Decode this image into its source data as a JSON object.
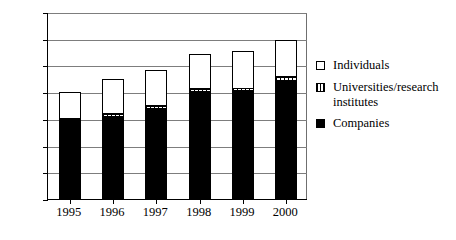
{
  "chart_data": {
    "type": "bar",
    "stacked": true,
    "title": "",
    "xlabel": "",
    "ylabel": "",
    "categories": [
      "1995",
      "1996",
      "1997",
      "1998",
      "1999",
      "2000"
    ],
    "ylim": [
      0,
      700
    ],
    "yticks": [
      0,
      100,
      200,
      300,
      400,
      500,
      600,
      700
    ],
    "grid": true,
    "legend_position": "right",
    "series": [
      {
        "name": "Companies",
        "color": "#000000",
        "pattern": "solid",
        "values": [
          298,
          308,
          338,
          402,
          405,
          443
        ]
      },
      {
        "name": "Universities/research institutes",
        "color": "#ffffff",
        "pattern": "dotted",
        "values": [
          0,
          10,
          12,
          10,
          8,
          12
        ]
      },
      {
        "name": "Individuals",
        "color": "#ffffff",
        "pattern": "open",
        "values": [
          102,
          132,
          133,
          131,
          142,
          140
        ]
      }
    ],
    "totals": [
      400,
      450,
      483,
      543,
      555,
      595
    ]
  },
  "axis": {
    "y_tick_labels": [
      "700",
      "600",
      "500",
      "400",
      "300",
      "200",
      "100",
      "0"
    ],
    "x_tick_labels": [
      "1995",
      "1996",
      "1997",
      "1998",
      "1999",
      "2000"
    ]
  },
  "legend": {
    "items": [
      {
        "label": "Individuals",
        "swatch": "open-square-icon"
      },
      {
        "label": "Universities/research institutes",
        "swatch": "dotted-square-icon"
      },
      {
        "label": "Companies",
        "swatch": "filled-square-icon"
      }
    ]
  }
}
